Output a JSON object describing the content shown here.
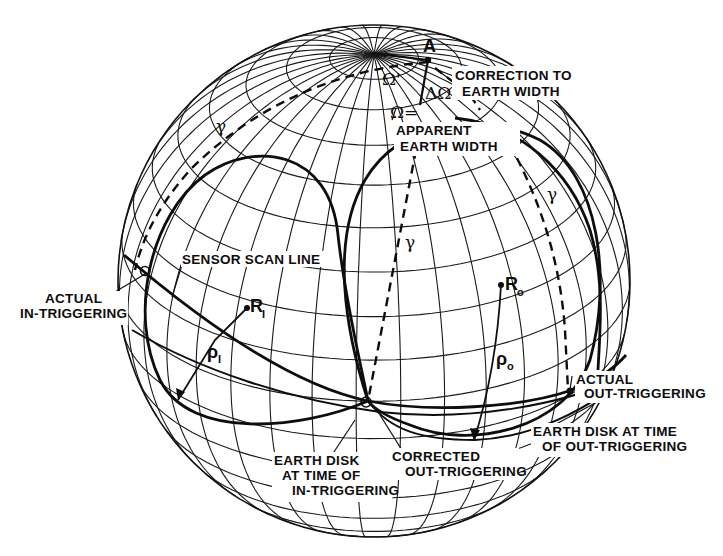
{
  "figure": {
    "type": "globe-diagram"
  },
  "labels": {
    "point_a": "A",
    "omega_prime": "Ω'",
    "delta_omega": "ΔΩ",
    "omega_eq": "Ω=",
    "correction_line1": "CORRECTION TO",
    "correction_line2": "EARTH WIDTH",
    "apparent_line1": "APPARENT",
    "apparent_line2": "EARTH WIDTH",
    "gamma": "γ",
    "sensor_scan_line": "SENSOR SCAN LINE",
    "actual_in_line1": "ACTUAL",
    "actual_in_line2": "IN-TRIGGERING",
    "r_i_main": "R",
    "r_i_sub": "I",
    "rho_i_main": "ρ",
    "rho_i_sub": "I",
    "r_o_main": "R",
    "r_o_sub": "o",
    "rho_o_main": "ρ",
    "rho_o_sub": "o",
    "actual_out_line1": "ACTUAL",
    "actual_out_line2": "OUT-TRIGGERING",
    "disk_out_line1": "EARTH DISK AT TIME",
    "disk_out_line2": "OF OUT-TRIGGERING",
    "corrected_line1": "CORRECTED",
    "corrected_line2": "OUT-TRIGGERING",
    "disk_in_line1": "EARTH DISK",
    "disk_in_line2": "AT TIME OF",
    "disk_in_line3": "IN-TRIGGERING"
  },
  "colors": {
    "ink": "#0d0d0d",
    "background": "#ffffff"
  }
}
